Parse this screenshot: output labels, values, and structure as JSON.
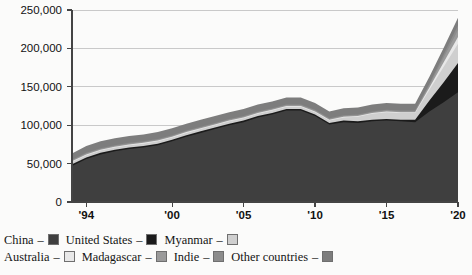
{
  "chart_data": {
    "type": "area",
    "stacked": true,
    "title": "",
    "xlabel": "",
    "ylabel": "",
    "ylim": [
      0,
      250000
    ],
    "ytick_values": [
      0,
      50000,
      100000,
      150000,
      200000,
      250000
    ],
    "ytick_labels": [
      "0",
      "50,000",
      "100,000",
      "150,000",
      "200,000",
      "250,000"
    ],
    "grid": true,
    "legend_position": "bottom",
    "xlim": [
      1993,
      2020
    ],
    "xtick_values": [
      1994,
      2000,
      2005,
      2010,
      2015,
      2020
    ],
    "xtick_labels": [
      "'94",
      "'00",
      "'05",
      "'10",
      "'15",
      "'20"
    ],
    "x": [
      1993,
      1994,
      1995,
      1996,
      1997,
      1998,
      1999,
      2000,
      2001,
      2002,
      2003,
      2004,
      2005,
      2006,
      2007,
      2008,
      2009,
      2010,
      2011,
      2012,
      2013,
      2014,
      2015,
      2016,
      2017,
      2018,
      2019,
      2020
    ],
    "series": [
      {
        "name": "China",
        "color": "#3f3f3f",
        "values": [
          47000,
          56000,
          62000,
          66000,
          69000,
          71000,
          74000,
          79000,
          85000,
          90000,
          95000,
          100000,
          104000,
          110000,
          114000,
          119000,
          119000,
          112000,
          101000,
          104000,
          103000,
          105000,
          106000,
          105000,
          104000,
          118000,
          130000,
          143000
        ]
      },
      {
        "name": "United States",
        "color": "#1b1b1b",
        "values": [
          2000,
          2000,
          2000,
          2000,
          2000,
          2000,
          2000,
          2000,
          2000,
          2000,
          2000,
          2000,
          2000,
          2000,
          2000,
          2000,
          2000,
          2000,
          2000,
          2000,
          2000,
          2000,
          2000,
          2000,
          3000,
          14000,
          26000,
          38000
        ]
      },
      {
        "name": "Myanmar",
        "color": "#cfcfcf",
        "values": [
          3000,
          3000,
          3000,
          3000,
          3000,
          3000,
          3000,
          3000,
          3000,
          3000,
          3000,
          3000,
          3000,
          3000,
          3000,
          3000,
          3000,
          3000,
          3000,
          4000,
          6000,
          8000,
          9000,
          9000,
          9000,
          14000,
          20000,
          25000
        ]
      },
      {
        "name": "Australia",
        "color": "#e8e8e8",
        "values": [
          1000,
          1000,
          1000,
          1000,
          1000,
          1000,
          1000,
          1000,
          1000,
          1000,
          1000,
          1000,
          1000,
          1000,
          1000,
          1000,
          1000,
          1000,
          1000,
          1000,
          1000,
          1000,
          1000,
          1000,
          1000,
          3000,
          6000,
          9000
        ]
      },
      {
        "name": "Madagascar",
        "color": "#9a9a9a",
        "values": [
          1000,
          1000,
          1000,
          1000,
          1000,
          1000,
          1000,
          1000,
          1000,
          1000,
          1000,
          1000,
          1000,
          1000,
          1000,
          1000,
          1000,
          1000,
          1000,
          1000,
          1000,
          1000,
          1000,
          1000,
          1000,
          3000,
          6000,
          9000
        ]
      },
      {
        "name": "Indie",
        "color": "#8c8c8c",
        "values": [
          1000,
          1000,
          1000,
          1000,
          1000,
          1000,
          1000,
          1000,
          1000,
          1000,
          1000,
          1000,
          1000,
          1000,
          1000,
          1000,
          1000,
          1000,
          1000,
          1000,
          1000,
          1000,
          1000,
          1000,
          1000,
          2000,
          4000,
          6000
        ]
      },
      {
        "name": "Other countries",
        "color": "#7d7d7d",
        "values": [
          8000,
          9000,
          9000,
          9000,
          9000,
          9000,
          9000,
          9000,
          9000,
          9000,
          9000,
          9000,
          9000,
          9000,
          9000,
          9000,
          9000,
          9000,
          9000,
          9000,
          9000,
          9000,
          9000,
          9000,
          9000,
          9000,
          9000,
          10000
        ]
      }
    ]
  },
  "legend": {
    "rows": [
      [
        {
          "label": "China",
          "dash": "–",
          "color": "#3f3f3f"
        },
        {
          "label": "United States",
          "dash": "–",
          "color": "#1b1b1b"
        },
        {
          "label": "Myanmar",
          "dash": "–",
          "color": "#cfcfcf"
        }
      ],
      [
        {
          "label": "Australia",
          "dash": "–",
          "color": "#e8e8e8"
        },
        {
          "label": "Madagascar",
          "dash": "–",
          "color": "#9a9a9a"
        },
        {
          "label": "Indie",
          "dash": "–",
          "color": "#8c8c8c"
        },
        {
          "label": "Other countries",
          "dash": "–",
          "color": "#7d7d7d"
        }
      ]
    ]
  }
}
